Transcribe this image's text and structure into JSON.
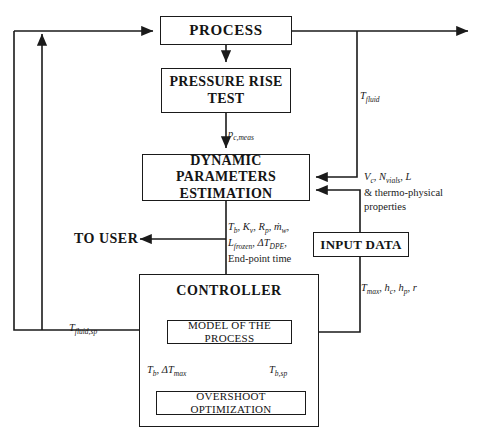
{
  "diagram": {
    "type": "block-flow-diagram",
    "colors": {
      "line": "#1a1a1a",
      "text": "#141414",
      "background": "#ffffff"
    },
    "blocks": {
      "process": {
        "label": "PROCESS"
      },
      "pressure_rise_test": {
        "line1": "PRESSURE RISE",
        "line2": "TEST"
      },
      "dynamic_parameters_estimation": {
        "line1": "DYNAMIC PARAMETERS",
        "line2": "ESTIMATION"
      },
      "input_data": {
        "label": "INPUT DATA"
      },
      "controller": {
        "label": "CONTROLLER"
      },
      "model_of_the_process": {
        "label": "MODEL OF THE PROCESS"
      },
      "overshoot_optimization": {
        "label": "OVERSHOOT OPTIMIZATION"
      },
      "to_user": {
        "label": "TO USER"
      }
    },
    "signal_labels": {
      "t_fluid": "T_fluid",
      "pc_meas": "p_c,meas",
      "input_to_dpe_line1": "V_c, N_vials, L",
      "input_to_dpe_line2": "& thermo-physical",
      "input_to_dpe_line3": "properties",
      "dpe_out_line1": "T_b, K_v, R_p, ṁ_w,",
      "dpe_out_line2": "L_frozen, ΔT_DPE,",
      "dpe_out_line3": "End-point time",
      "input_to_controller": "T_max, h_c, h_p, r",
      "t_fluid_sp": "T_fluid,sp",
      "model_to_overshoot": "T_b, ΔT_max",
      "overshoot_to_model": "T_b,sp"
    }
  }
}
